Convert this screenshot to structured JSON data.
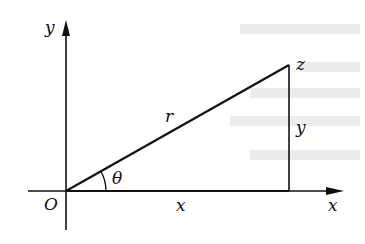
{
  "diagram": {
    "type": "right-triangle-polar-coordinates",
    "labels": {
      "y_axis": "y",
      "x_axis": "x",
      "origin": "O",
      "point": "z",
      "hypotenuse": "r",
      "opposite": "y",
      "adjacent": "x",
      "angle": "θ"
    },
    "colors": {
      "stroke": "#111111",
      "background": "#ffffff",
      "bleed_through": "#e8e8e8"
    }
  }
}
